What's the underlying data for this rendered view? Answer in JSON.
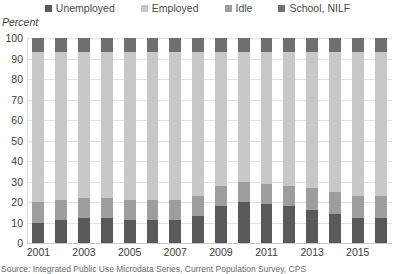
{
  "axis_title": "Percent",
  "source_note": "Source: Integrated Public Use Microdata Series, Current Population Survey, CPS",
  "colors": {
    "unemployed": "#595959",
    "employed": "#c8c8c8",
    "idle": "#9e9e9e",
    "school_nilf": "#707070",
    "gridline": "#e2e2e2",
    "text": "#3d3d3d"
  },
  "legend": {
    "items": [
      {
        "label": "Unemployed",
        "color": "#595959"
      },
      {
        "label": "Employed",
        "color": "#c8c8c8"
      },
      {
        "label": "Idle",
        "color": "#9e9e9e"
      },
      {
        "label": "School, NILF",
        "color": "#707070"
      }
    ]
  },
  "chart_data": {
    "type": "bar",
    "subtype": "stacked-column-100",
    "title": "",
    "xlabel": "",
    "ylabel": "Percent",
    "ylim": [
      0,
      100
    ],
    "yticks": [
      0,
      10,
      20,
      30,
      40,
      50,
      60,
      70,
      80,
      90,
      100
    ],
    "grid": true,
    "legend_position": "top",
    "categories": [
      "2001",
      "2002",
      "2003",
      "2004",
      "2005",
      "2006",
      "2007",
      "2008",
      "2009",
      "2010",
      "2011",
      "2012",
      "2013",
      "2014",
      "2015",
      "2016"
    ],
    "xtick_labels": [
      "2001",
      "2003",
      "2005",
      "2007",
      "2009",
      "2011",
      "2013",
      "2015"
    ],
    "series": [
      {
        "name": "Unemployed",
        "color": "#595959",
        "values": [
          10,
          11,
          12,
          12,
          11,
          11,
          11,
          13,
          18,
          20,
          19,
          18,
          16,
          14,
          12,
          12
        ]
      },
      {
        "name": "Idle",
        "color": "#9e9e9e",
        "values": [
          10,
          10,
          10,
          10,
          10,
          10,
          10,
          10,
          10,
          10,
          10,
          10,
          11,
          11,
          11,
          11
        ]
      },
      {
        "name": "Employed",
        "color": "#c8c8c8",
        "values": [
          73,
          72,
          71,
          71,
          72,
          72,
          72,
          70,
          65,
          63,
          64,
          65,
          66,
          68,
          70,
          70
        ]
      },
      {
        "name": "School, NILF",
        "color": "#707070",
        "values": [
          7,
          7,
          7,
          7,
          7,
          7,
          7,
          7,
          7,
          7,
          7,
          7,
          7,
          7,
          7,
          7
        ]
      }
    ]
  }
}
